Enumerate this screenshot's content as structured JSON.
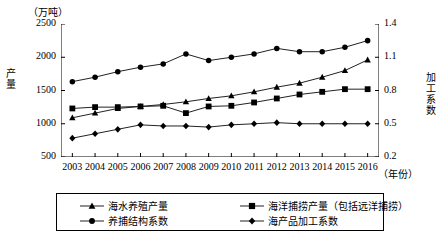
{
  "chart_data": {
    "type": "line",
    "title": "",
    "unit_note": "（万吨）",
    "xlabel": "（年份）",
    "ylabel_left": "产量",
    "ylabel_right": "加工系数",
    "x": [
      2003,
      2004,
      2005,
      2006,
      2007,
      2008,
      2009,
      2010,
      2011,
      2012,
      2013,
      2014,
      2015,
      2016
    ],
    "xtick_labels": [
      "2003",
      "2004",
      "2005",
      "2006",
      "2007",
      "2008",
      "2009",
      "2010",
      "2011",
      "2012",
      "2013",
      "2014",
      "2015",
      "2016"
    ],
    "ylim_left": [
      500,
      2500
    ],
    "ytick_left": [
      "500",
      "1000",
      "1500",
      "2000",
      "2500"
    ],
    "ylim_right": [
      0.2,
      1.4
    ],
    "ytick_right": [
      "0.2",
      "0.5",
      "0.8",
      "1.1",
      "1.4"
    ],
    "grid": false,
    "legend_position": "bottom",
    "series": [
      {
        "name": "海水养殖产量",
        "marker": "triangle",
        "axis": "left",
        "values": [
          1090,
          1160,
          1230,
          1260,
          1290,
          1330,
          1380,
          1420,
          1480,
          1550,
          1610,
          1700,
          1800,
          1960
        ]
      },
      {
        "name": "海洋捕捞产量（包括远洋捕捞）",
        "marker": "square",
        "axis": "left",
        "values": [
          1230,
          1250,
          1250,
          1260,
          1270,
          1160,
          1260,
          1270,
          1320,
          1380,
          1440,
          1480,
          1520,
          1520
        ]
      },
      {
        "name": "养捕结构系数",
        "marker": "circle",
        "axis": "right",
        "values": [
          0.88,
          0.92,
          0.97,
          1.01,
          1.04,
          1.13,
          1.07,
          1.1,
          1.13,
          1.18,
          1.15,
          1.15,
          1.19,
          1.25
        ]
      },
      {
        "name": "海产品加工系数",
        "marker": "diamond",
        "axis": "right",
        "values": [
          0.37,
          0.41,
          0.45,
          0.49,
          0.48,
          0.48,
          0.47,
          0.49,
          0.5,
          0.51,
          0.5,
          0.5,
          0.5,
          0.5
        ]
      }
    ]
  },
  "legend": {
    "items": [
      {
        "label": "海水养殖产量",
        "marker": "triangle"
      },
      {
        "label": "海洋捕捞产量（包括远洋捕捞）",
        "marker": "square"
      },
      {
        "label": "养捕结构系数",
        "marker": "circle"
      },
      {
        "label": "海产品加工系数",
        "marker": "diamond"
      }
    ]
  }
}
